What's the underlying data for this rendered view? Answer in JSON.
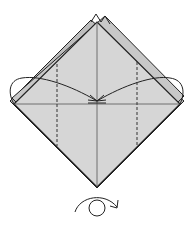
{
  "diagram": {
    "type": "origami-step",
    "colors": {
      "paper_fill": "#d4d4d4",
      "paper_back": "#c4c4c4",
      "outline": "#222222",
      "background": "#ffffff"
    },
    "instructions": {
      "valley_folds": [
        "left-dashed-line",
        "right-dashed-line"
      ],
      "arrows": [
        "fold-left-flap-to-center",
        "fold-right-flap-to-center"
      ],
      "symbol": "turn-over"
    }
  }
}
